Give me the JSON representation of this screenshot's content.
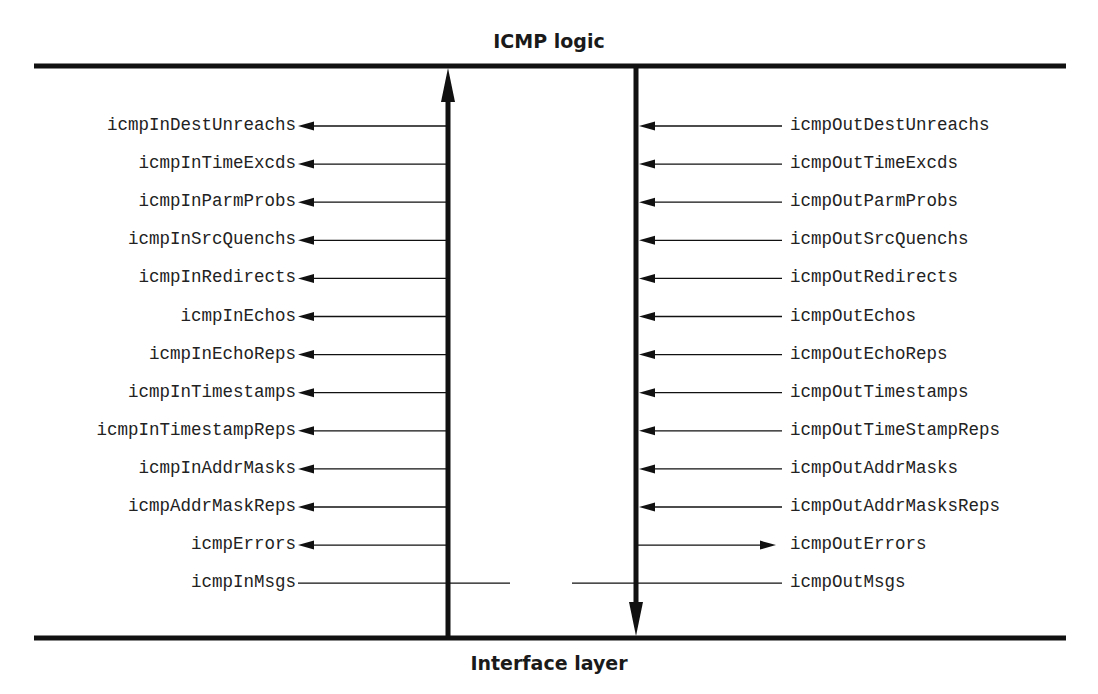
{
  "diagram": {
    "top_label": "ICMP logic",
    "bottom_label": "Interface layer",
    "colors": {
      "line": "#111111",
      "text": "#222222",
      "background": "#ffffff"
    },
    "left_column": {
      "direction": "up",
      "items": [
        {
          "label": "icmpInDestUnreachs",
          "arrow": "left"
        },
        {
          "label": "icmpInTimeExcds",
          "arrow": "left"
        },
        {
          "label": "icmpInParmProbs",
          "arrow": "left"
        },
        {
          "label": "icmpInSrcQuenchs",
          "arrow": "left"
        },
        {
          "label": "icmpInRedirects",
          "arrow": "left"
        },
        {
          "label": "icmpInEchos",
          "arrow": "left"
        },
        {
          "label": "icmpInEchoReps",
          "arrow": "left"
        },
        {
          "label": "icmpInTimestamps",
          "arrow": "left"
        },
        {
          "label": "icmpInTimestampReps",
          "arrow": "left"
        },
        {
          "label": "icmpInAddrMasks",
          "arrow": "left"
        },
        {
          "label": "icmpAddrMaskReps",
          "arrow": "left"
        },
        {
          "label": "icmpErrors",
          "arrow": "left"
        },
        {
          "label": "icmpInMsgs",
          "arrow": "none"
        }
      ]
    },
    "right_column": {
      "direction": "down",
      "items": [
        {
          "label": "icmpOutDestUnreachs",
          "arrow": "left"
        },
        {
          "label": "icmpOutTimeExcds",
          "arrow": "left"
        },
        {
          "label": "icmpOutParmProbs",
          "arrow": "left"
        },
        {
          "label": "icmpOutSrcQuenchs",
          "arrow": "left"
        },
        {
          "label": "icmpOutRedirects",
          "arrow": "left"
        },
        {
          "label": "icmpOutEchos",
          "arrow": "left"
        },
        {
          "label": "icmpOutEchoReps",
          "arrow": "left"
        },
        {
          "label": "icmpOutTimestamps",
          "arrow": "left"
        },
        {
          "label": "icmpOutTimeStampReps",
          "arrow": "left"
        },
        {
          "label": "icmpOutAddrMasks",
          "arrow": "left"
        },
        {
          "label": "icmpOutAddrMasksReps",
          "arrow": "left"
        },
        {
          "label": "icmpOutErrors",
          "arrow": "right"
        },
        {
          "label": "icmpOutMsgs",
          "arrow": "none"
        }
      ]
    }
  }
}
